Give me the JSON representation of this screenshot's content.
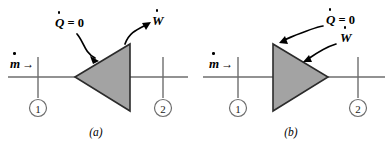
{
  "figure": {
    "panels": [
      {
        "id": "a",
        "caption": "(a)",
        "mass_flow_label": "m",
        "mass_flow_arrow": "→",
        "heat_label": "Q",
        "heat_value": "= 0",
        "work_label": "W",
        "inlet_station": "1",
        "outlet_station": "2",
        "shape_orientation": "apex-left"
      },
      {
        "id": "b",
        "caption": "(b)",
        "mass_flow_label": "m",
        "mass_flow_arrow": "→",
        "heat_label": "Q",
        "heat_value": "= 0",
        "work_label": "W",
        "inlet_station": "1",
        "outlet_station": "2",
        "shape_orientation": "apex-right"
      }
    ]
  },
  "colors": {
    "device_fill": "#a3a3a3",
    "device_stroke": "#2b2b2b",
    "line": "#6e6e6e",
    "text": "#000000",
    "background": "#ffffff"
  }
}
